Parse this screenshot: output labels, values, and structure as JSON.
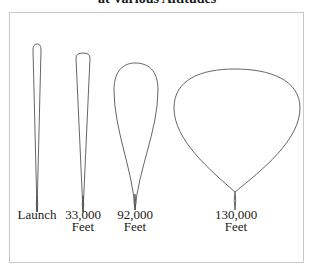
{
  "title": "at Various Altitudes",
  "balloons": [
    {
      "id": "launch",
      "line1": "Launch",
      "line2": ""
    },
    {
      "id": "33000",
      "line1": "33,000",
      "line2": "Feet"
    },
    {
      "id": "92000",
      "line1": "92,000",
      "line2": "Feet"
    },
    {
      "id": "130000",
      "line1": "130,000",
      "line2": "Feet"
    }
  ],
  "colors": {
    "outline": "#555555",
    "frame": "#c8c8c8"
  }
}
